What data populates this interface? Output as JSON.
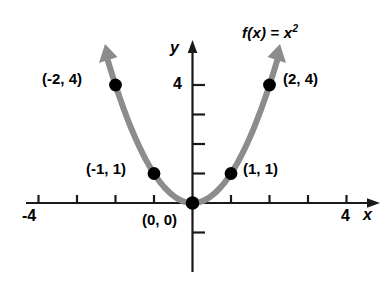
{
  "chart_data": {
    "type": "line",
    "title": "",
    "function_label": {
      "prefix": "f(x)",
      "equals": " = ",
      "base": "x",
      "exponent": "2",
      "full": "f(x) = x2"
    },
    "xlabel": "x",
    "ylabel": "y",
    "xlim": [
      -4.9,
      4.9
    ],
    "ylim": [
      -2.2,
      4.9
    ],
    "grid": false,
    "legend": "none",
    "x_tick_labels": [
      {
        "value": -4,
        "text": "-4"
      },
      {
        "value": 4,
        "text": "4"
      }
    ],
    "y_tick_labels": [
      {
        "value": 4,
        "text": "4"
      }
    ],
    "x_ticks": [
      -4,
      -3,
      -2,
      -1,
      1,
      2,
      3,
      4
    ],
    "y_ticks": [
      1,
      2,
      3,
      4,
      -1
    ],
    "curve": {
      "expression": "y = x^2",
      "x_start": -2.22,
      "x_end": 2.22,
      "color": "#8c8c8c",
      "arrow_start": true,
      "arrow_end": true
    },
    "points": [
      {
        "x": -2,
        "y": 4,
        "label": "(-2, 4)",
        "label_side": "left"
      },
      {
        "x": -1,
        "y": 1,
        "label": "(-1, 1)",
        "label_side": "left"
      },
      {
        "x": 0,
        "y": 0,
        "label": "(0, 0)",
        "label_side": "below-left"
      },
      {
        "x": 1,
        "y": 1,
        "label": "(1, 1)",
        "label_side": "right"
      },
      {
        "x": 2,
        "y": 4,
        "label": "(2, 4)",
        "label_side": "right"
      }
    ],
    "colors": {
      "axis": "#1a1a1a",
      "curve": "#8c8c8c",
      "point": "#000000",
      "text": "#000000",
      "background": "#ffffff"
    }
  }
}
